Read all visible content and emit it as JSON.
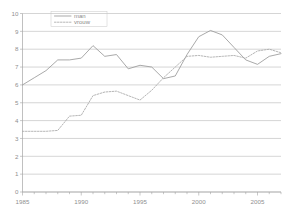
{
  "chart_data": {
    "type": "line",
    "title": "",
    "xlabel": "",
    "ylabel": "",
    "xlim": [
      1985,
      2007
    ],
    "ylim": [
      0,
      10
    ],
    "grid": true,
    "legend_position": "top-left",
    "x": [
      1985,
      1986,
      1987,
      1988,
      1989,
      1990,
      1991,
      1992,
      1993,
      1994,
      1995,
      1996,
      1997,
      1998,
      1999,
      2000,
      2001,
      2002,
      2003,
      2004,
      2005,
      2006,
      2007
    ],
    "xticks": [
      1985,
      1990,
      1995,
      2000,
      2005
    ],
    "xtick_labels": [
      "1985",
      "1990",
      "1995",
      "2000",
      "2005"
    ],
    "yticks": [
      0,
      1,
      2,
      3,
      4,
      5,
      6,
      7,
      8,
      9,
      10
    ],
    "ytick_labels": [
      "0",
      "1",
      "2",
      "3",
      "4",
      "5",
      "6",
      "7",
      "8",
      "9",
      "10"
    ],
    "series": [
      {
        "name": "man",
        "style": "solid",
        "color": "#9a9a9a",
        "values": [
          6.0,
          6.4,
          6.8,
          7.4,
          7.4,
          7.5,
          8.2,
          7.6,
          7.7,
          6.9,
          7.1,
          7.0,
          6.35,
          6.5,
          7.7,
          8.7,
          9.05,
          8.8,
          8.1,
          7.4,
          7.15,
          7.6,
          7.75
        ]
      },
      {
        "name": "vrouw",
        "style": "dotted",
        "color": "#a8a8a8",
        "values": [
          3.4,
          3.4,
          3.4,
          3.45,
          4.25,
          4.3,
          5.4,
          5.6,
          5.65,
          5.4,
          5.15,
          5.7,
          6.4,
          7.0,
          7.6,
          7.65,
          7.55,
          7.6,
          7.65,
          7.5,
          7.9,
          8.0,
          7.8
        ]
      }
    ]
  },
  "legend": {
    "items": [
      {
        "label": "man",
        "style": "solid"
      },
      {
        "label": "vrouw",
        "style": "dotted"
      }
    ]
  }
}
